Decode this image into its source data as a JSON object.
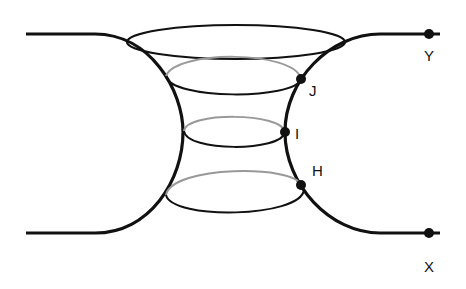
{
  "diagram": {
    "colors": {
      "stroke": "#111111",
      "hidden_stroke": "#999999",
      "background": "#ffffff"
    },
    "points": [
      {
        "id": "J",
        "label": "J"
      },
      {
        "id": "I",
        "label": "I"
      },
      {
        "id": "H",
        "label": "H"
      },
      {
        "id": "Y",
        "label": "Y"
      },
      {
        "id": "X",
        "label": "X"
      }
    ]
  }
}
